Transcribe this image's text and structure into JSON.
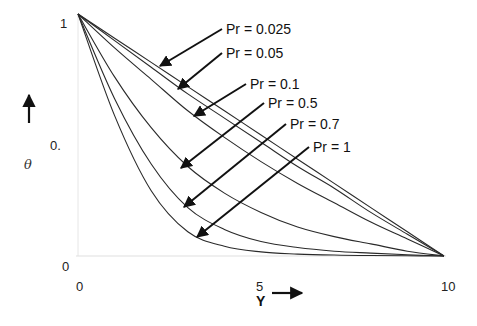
{
  "chart_data": {
    "type": "line",
    "title": "",
    "xlabel": "Y",
    "ylabel": "θ",
    "xlim": [
      0,
      10
    ],
    "ylim": [
      0,
      1
    ],
    "x_ticks": [
      "0",
      "5",
      "10"
    ],
    "y_ticks": [
      "0",
      "0.",
      "1"
    ],
    "grid": false,
    "legend_position": "annotations with arrows",
    "x": [
      0,
      1,
      2,
      3,
      4,
      5,
      6,
      7,
      8,
      9,
      10
    ],
    "series": [
      {
        "name": "Pr = 0.025",
        "values": [
          1.0,
          0.9,
          0.8,
          0.7,
          0.6,
          0.5,
          0.4,
          0.3,
          0.2,
          0.1,
          0.0
        ]
      },
      {
        "name": "Pr = 0.05",
        "values": [
          1.0,
          0.89,
          0.78,
          0.67,
          0.57,
          0.47,
          0.37,
          0.28,
          0.18,
          0.09,
          0.0
        ]
      },
      {
        "name": "Pr = 0.1",
        "values": [
          1.0,
          0.86,
          0.73,
          0.6,
          0.49,
          0.39,
          0.3,
          0.22,
          0.14,
          0.07,
          0.0
        ]
      },
      {
        "name": "Pr = 0.5",
        "values": [
          1.0,
          0.74,
          0.53,
          0.37,
          0.26,
          0.18,
          0.12,
          0.08,
          0.05,
          0.02,
          0.0
        ]
      },
      {
        "name": "Pr = 0.7",
        "values": [
          1.0,
          0.65,
          0.38,
          0.2,
          0.11,
          0.06,
          0.035,
          0.02,
          0.012,
          0.005,
          0.0
        ]
      },
      {
        "name": "Pr = 1",
        "values": [
          1.0,
          0.58,
          0.27,
          0.1,
          0.04,
          0.017,
          0.008,
          0.004,
          0.002,
          0.001,
          0.0
        ]
      }
    ],
    "annotations": [
      {
        "text": "Pr = 0.025",
        "text_xy": [
          226,
          34
        ],
        "arrow_to": [
          160,
          66
        ]
      },
      {
        "text": "Pr = 0.05",
        "text_xy": [
          226,
          58
        ],
        "arrow_to": [
          178,
          89
        ]
      },
      {
        "text": "Pr = 0.1",
        "text_xy": [
          250,
          89
        ],
        "arrow_to": [
          194,
          116
        ]
      },
      {
        "text": "Pr = 0.5",
        "text_xy": [
          268,
          108
        ],
        "arrow_to": [
          181,
          168
        ]
      },
      {
        "text": "Pr = 0.7",
        "text_xy": [
          290,
          129
        ],
        "arrow_to": [
          184,
          207
        ]
      },
      {
        "text": "Pr = 1",
        "text_xy": [
          313,
          152
        ],
        "arrow_to": [
          197,
          237
        ]
      }
    ]
  },
  "axes": {
    "ylabel": "θ",
    "xlabel": "Y",
    "y_tick_top": "1",
    "y_tick_mid": "0.",
    "y_tick_bottom": "0",
    "x_tick_0": "0",
    "x_tick_5": "5",
    "x_tick_10": "10"
  }
}
